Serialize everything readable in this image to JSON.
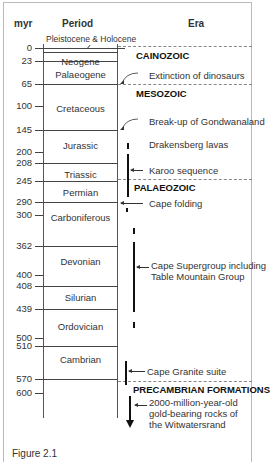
{
  "headers": {
    "myr": "myr",
    "period": "Period",
    "era": "Era"
  },
  "top_label": "Pleistocene & Holocene",
  "ticks": [
    {
      "value": "0",
      "y": 48
    },
    {
      "value": "23",
      "y": 61
    },
    {
      "value": "65",
      "y": 84
    },
    {
      "value": "100",
      "y": 106
    },
    {
      "value": "145",
      "y": 130
    },
    {
      "value": "200",
      "y": 152
    },
    {
      "value": "208",
      "y": 163
    },
    {
      "value": "245",
      "y": 181
    },
    {
      "value": "290",
      "y": 202
    },
    {
      "value": "300",
      "y": 215
    },
    {
      "value": "362",
      "y": 246
    },
    {
      "value": "400",
      "y": 275
    },
    {
      "value": "408",
      "y": 286
    },
    {
      "value": "439",
      "y": 309
    },
    {
      "value": "500",
      "y": 338
    },
    {
      "value": "510",
      "y": 346
    },
    {
      "value": "570",
      "y": 379
    },
    {
      "value": "600",
      "y": 393
    }
  ],
  "periods": [
    {
      "name": "Neogene",
      "y": 56
    },
    {
      "name": "Palaeogene",
      "y": 69
    },
    {
      "name": "Cretaceous",
      "y": 103
    },
    {
      "name": "Jurassic",
      "y": 140
    },
    {
      "name": "Triassic",
      "y": 169
    },
    {
      "name": "Permian",
      "y": 187
    },
    {
      "name": "Carboniferous",
      "y": 212
    },
    {
      "name": "Devonian",
      "y": 256
    },
    {
      "name": "Silurian",
      "y": 292
    },
    {
      "name": "Ordovician",
      "y": 321
    },
    {
      "name": "Cambrian",
      "y": 354
    }
  ],
  "eras": [
    {
      "name": "CAINOZOIC",
      "y": 48
    },
    {
      "name": "MESOZOIC",
      "y": 88
    },
    {
      "name": "PALAEOZOIC",
      "y": 180
    },
    {
      "name": "PRECAMBRIAN FORMATIONS",
      "y": 383
    }
  ],
  "events": {
    "extinction": "Extinction of dinosaurs",
    "gondwana": "Break-up of Gondwanaland",
    "drakensberg": "Drakensberg lavas",
    "karoo": "Karoo sequence",
    "cape_folding": "Cape folding",
    "cape_supergroup_1": "Cape Supergroup including",
    "cape_supergroup_2": "Table Mountain Group",
    "cape_granite": "Cape Granite suite",
    "witwatersrand_1": "2000-million-year-old",
    "witwatersrand_2": "gold-bearing rocks of",
    "witwatersrand_3": "the Witwatersrand"
  },
  "caption": "Figure 2.1"
}
